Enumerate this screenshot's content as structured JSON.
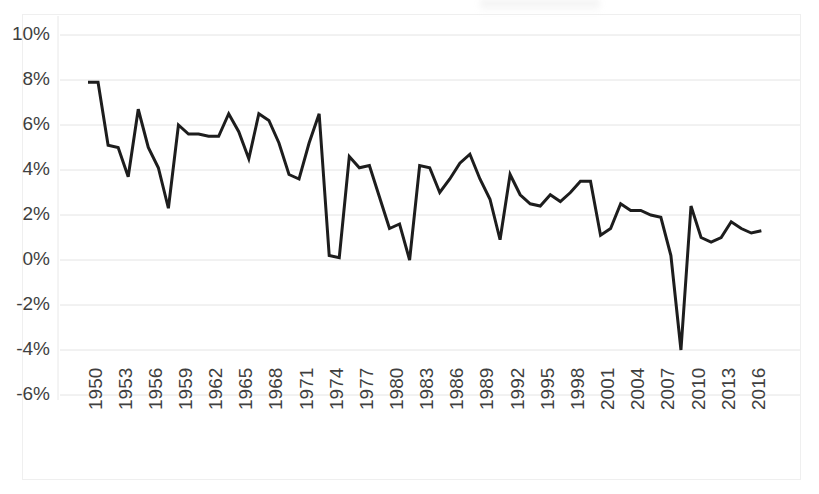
{
  "chart_data": {
    "type": "line",
    "title": "",
    "subtitle": "",
    "xlabel": "",
    "ylabel": "",
    "grid": true,
    "legend": false,
    "legend_position": "none",
    "ylim": [
      -6,
      10
    ],
    "ytick_values": [
      10,
      8,
      6,
      4,
      2,
      0,
      -2,
      -4,
      -6
    ],
    "ytick_labels": [
      "10%",
      "8%",
      "6%",
      "4%",
      "2%",
      "0%",
      "-2%",
      "-4%",
      "-6%"
    ],
    "xlim": [
      1950,
      2017
    ],
    "xtick_labels": [
      "1950",
      "1953",
      "1956",
      "1959",
      "1962",
      "1965",
      "1968",
      "1971",
      "1974",
      "1977",
      "1980",
      "1983",
      "1986",
      "1989",
      "1992",
      "1995",
      "1998",
      "2001",
      "2004",
      "2007",
      "2010",
      "2013",
      "2016"
    ],
    "xtick_values": [
      1950,
      1953,
      1956,
      1959,
      1962,
      1965,
      1968,
      1971,
      1974,
      1977,
      1980,
      1983,
      1986,
      1989,
      1992,
      1995,
      1998,
      2001,
      2004,
      2007,
      2010,
      2013,
      2016
    ],
    "series": [
      {
        "name": "annual-rate",
        "color": "#1d1d1d",
        "x": [
          1950,
          1951,
          1952,
          1953,
          1954,
          1955,
          1956,
          1957,
          1958,
          1959,
          1960,
          1961,
          1962,
          1963,
          1964,
          1965,
          1966,
          1967,
          1968,
          1969,
          1970,
          1971,
          1972,
          1973,
          1974,
          1975,
          1976,
          1977,
          1978,
          1979,
          1980,
          1981,
          1982,
          1983,
          1984,
          1985,
          1986,
          1987,
          1988,
          1989,
          1990,
          1991,
          1992,
          1993,
          1994,
          1995,
          1996,
          1997,
          1998,
          1999,
          2000,
          2001,
          2002,
          2003,
          2004,
          2005,
          2006,
          2007,
          2008,
          2009,
          2010,
          2011,
          2012,
          2013,
          2014,
          2015,
          2016,
          2017
        ],
        "values": [
          7.9,
          7.9,
          5.1,
          5.0,
          3.7,
          6.7,
          5.0,
          4.1,
          2.3,
          6.0,
          5.6,
          5.6,
          5.5,
          5.5,
          6.5,
          5.7,
          4.5,
          6.5,
          6.2,
          5.2,
          3.8,
          3.6,
          5.2,
          6.5,
          0.2,
          0.1,
          4.6,
          4.1,
          4.2,
          2.8,
          1.4,
          1.6,
          0.0,
          4.2,
          4.1,
          3.0,
          3.6,
          4.3,
          4.7,
          3.6,
          2.7,
          0.9,
          3.8,
          2.9,
          2.5,
          2.4,
          2.9,
          2.6,
          3.0,
          3.5,
          3.5,
          1.1,
          1.4,
          2.5,
          2.2,
          2.2,
          2.0,
          1.9,
          0.2,
          -4.0,
          2.4,
          1.0,
          0.8,
          1.0,
          1.7,
          1.4,
          1.2,
          1.3
        ]
      }
    ]
  },
  "axis": {
    "y_unit": "percent",
    "x_unit": "year",
    "x_label_rotation": -90
  }
}
